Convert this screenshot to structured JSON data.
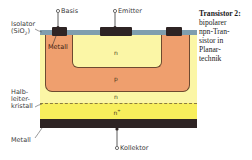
{
  "caption": {
    "title": "Transistor 2:",
    "lines": [
      "bipolarer",
      "npn-Tran-",
      "sistor in",
      "Planar-",
      "technik"
    ]
  },
  "terminals": {
    "base": "Basis",
    "emitter": "Emitter",
    "collector": "Kollektor"
  },
  "labels": {
    "insulator_line1": "Isolator",
    "insulator_line2": "(SiO",
    "insulator_sub": "2",
    "insulator_close": ")",
    "metal_top": "Metall",
    "crystal_line1": "Halb-",
    "crystal_line2": "leiter-",
    "crystal_line3": "kristall",
    "metal_bottom": "Metall"
  },
  "regions": {
    "emitter_n": "n",
    "base_p": "p",
    "collector_n": "n",
    "substrate_n_plus": "n",
    "substrate_sup": "+"
  },
  "colors": {
    "n_region": "#fbf6a6",
    "n_plus_region": "#f7ee5c",
    "p_region": "#ef9f6e",
    "insulator": "#7f9eae",
    "metal": "#2e2424"
  }
}
